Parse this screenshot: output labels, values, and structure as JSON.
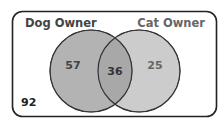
{
  "diagram": {
    "type": "venn",
    "universe_label": "",
    "sets": [
      {
        "name": "Dog Owner",
        "only_count": "57",
        "fill": "#b3b3b3"
      },
      {
        "name": "Cat Owner",
        "only_count": "25",
        "fill": "#cccccc"
      }
    ],
    "intersection_count": "36",
    "intersection_fill": "#a8a8a8",
    "outside_count": "92",
    "colors": {
      "border": "#222222",
      "circle_stroke": "#333333",
      "label_dog": "#444444",
      "label_cat": "#666666",
      "number_dark": "#333333",
      "number_light": "#666666"
    }
  }
}
